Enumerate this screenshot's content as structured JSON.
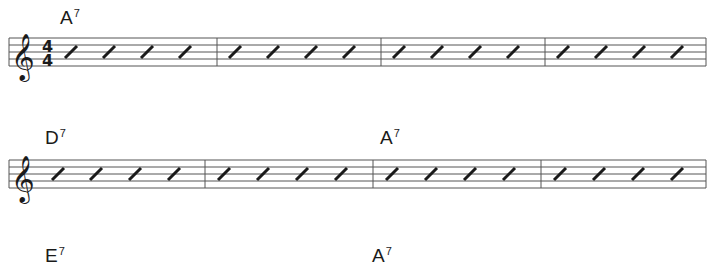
{
  "sheet": {
    "clef": "treble",
    "time_signature": {
      "top": "4",
      "bottom": "4"
    },
    "beats_per_measure": 4,
    "notation": "slash",
    "colors": {
      "ink": "#1a1a1a",
      "staff_line": "#555555",
      "background": "#ffffff"
    },
    "systems": [
      {
        "show_time_signature": true,
        "chords": [
          {
            "root": "A",
            "quality": "7",
            "measure": 1
          }
        ],
        "measures": 4
      },
      {
        "show_time_signature": false,
        "chords": [
          {
            "root": "D",
            "quality": "7",
            "measure": 1
          },
          {
            "root": "A",
            "quality": "7",
            "measure": 3
          }
        ],
        "measures": 4
      },
      {
        "show_time_signature": false,
        "chords": [
          {
            "root": "E",
            "quality": "7",
            "measure": 1
          },
          {
            "root": "A",
            "quality": "7",
            "measure": 3
          }
        ],
        "measures": 4
      }
    ]
  }
}
